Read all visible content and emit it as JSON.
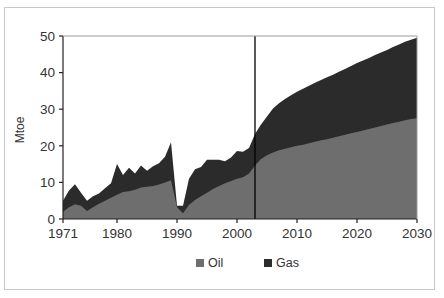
{
  "figure": {
    "title": "",
    "background_color": "#ffffff",
    "frame_color": "#c9c9c9"
  },
  "chart_data": {
    "type": "area",
    "stacked": true,
    "title": "",
    "xlabel": "",
    "ylabel": "Mtoe",
    "xlim": [
      1971,
      2030
    ],
    "ylim": [
      0,
      50
    ],
    "grid": false,
    "legend_position": "bottom",
    "xticks": [
      "1971",
      "1980",
      "1990",
      "2000",
      "2010",
      "2020",
      "2030"
    ],
    "xtick_values": [
      1971,
      1980,
      1990,
      2000,
      2010,
      2020,
      2030
    ],
    "yticks": [
      "0",
      "10",
      "20",
      "30",
      "40",
      "50"
    ],
    "ytick_values": [
      0,
      10,
      20,
      30,
      40,
      50
    ],
    "x": [
      1971,
      1972,
      1973,
      1974,
      1975,
      1976,
      1977,
      1978,
      1979,
      1980,
      1981,
      1982,
      1983,
      1984,
      1985,
      1986,
      1987,
      1988,
      1989,
      1990,
      1991,
      1992,
      1993,
      1994,
      1995,
      1996,
      1997,
      1998,
      1999,
      2000,
      2001,
      2002,
      2003,
      2004,
      2005,
      2006,
      2007,
      2008,
      2009,
      2010,
      2011,
      2012,
      2013,
      2014,
      2015,
      2016,
      2017,
      2018,
      2019,
      2020,
      2021,
      2022,
      2023,
      2024,
      2025,
      2026,
      2027,
      2028,
      2029,
      2030
    ],
    "series": [
      {
        "name": "Oil",
        "color": "#6e6e6e",
        "values": [
          2.0,
          3.2,
          4.0,
          3.6,
          2.2,
          3.2,
          4.2,
          5.0,
          5.8,
          6.6,
          7.4,
          7.6,
          8.0,
          8.6,
          8.8,
          9.0,
          9.4,
          10.0,
          10.6,
          3.2,
          1.6,
          3.8,
          5.2,
          6.2,
          7.2,
          8.2,
          9.0,
          9.8,
          10.4,
          11.0,
          11.4,
          12.4,
          14.6,
          16.4,
          17.4,
          18.2,
          18.8,
          19.2,
          19.6,
          20.0,
          20.3,
          20.7,
          21.1,
          21.5,
          21.8,
          22.2,
          22.6,
          23.0,
          23.4,
          23.8,
          24.2,
          24.6,
          25.0,
          25.4,
          25.8,
          26.2,
          26.6,
          27.0,
          27.3,
          27.5
        ]
      },
      {
        "name": "Gas",
        "color": "#2b2b2b",
        "values": [
          3.0,
          4.6,
          5.5,
          3.6,
          2.8,
          3.0,
          2.8,
          3.4,
          4.0,
          8.4,
          4.6,
          6.4,
          4.4,
          6.0,
          4.4,
          5.4,
          5.8,
          7.0,
          10.4,
          0.4,
          2.0,
          7.2,
          8.4,
          8.0,
          9.0,
          8.0,
          7.2,
          6.0,
          6.4,
          7.6,
          7.0,
          7.0,
          8.6,
          9.4,
          10.6,
          12.0,
          12.8,
          13.6,
          14.2,
          14.8,
          15.3,
          15.7,
          16.1,
          16.5,
          16.9,
          17.2,
          17.6,
          18.0,
          18.4,
          18.8,
          19.1,
          19.4,
          19.8,
          20.1,
          20.4,
          20.8,
          21.1,
          21.4,
          21.7,
          22.0
        ]
      }
    ],
    "annotations": [
      {
        "name": "projection-divider",
        "type": "vline",
        "x": 2003,
        "color": "#000000"
      }
    ]
  },
  "legend": {
    "items": [
      {
        "label": "Oil",
        "color": "#6e6e6e"
      },
      {
        "label": "Gas",
        "color": "#2b2b2b"
      }
    ]
  }
}
